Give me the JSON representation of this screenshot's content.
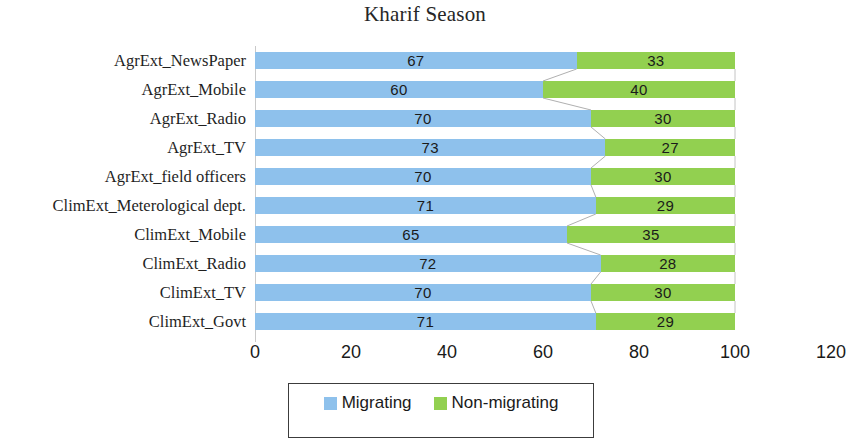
{
  "chart_data": {
    "type": "bar",
    "subtype": "stacked-horizontal-bar",
    "title": "Kharif Season",
    "xlabel": "",
    "ylabel": "",
    "xlim": [
      0,
      120
    ],
    "xticks": [
      "0",
      "20",
      "40",
      "60",
      "80",
      "100",
      "120"
    ],
    "xtick_values": [
      0,
      20,
      40,
      60,
      80,
      100,
      120
    ],
    "grid": false,
    "legend_position": "bottom",
    "categories": [
      "AgrExt_NewsPaper",
      "AgrExt_Mobile",
      "AgrExt_Radio",
      "AgrExt_TV",
      "AgrExt_field officers",
      "ClimExt_Meterological dept.",
      "ClimExt_Mobile",
      "ClimExt_Radio",
      "ClimExt_TV",
      "ClimExt_Govt"
    ],
    "series": [
      {
        "name": "Migrating",
        "color": "#8EC1EC",
        "values": [
          67,
          60,
          70,
          73,
          70,
          71,
          65,
          72,
          70,
          71
        ]
      },
      {
        "name": "Non-migrating",
        "color": "#92D050",
        "values": [
          33,
          40,
          30,
          27,
          30,
          29,
          35,
          28,
          30,
          29
        ]
      }
    ]
  },
  "legend": {
    "entries": [
      {
        "label": "Migrating",
        "color": "#8EC1EC"
      },
      {
        "label": "Non-migrating",
        "color": "#92D050"
      }
    ]
  }
}
